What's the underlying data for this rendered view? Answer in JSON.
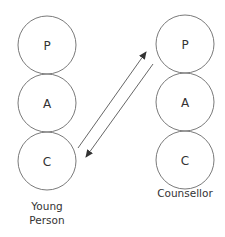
{
  "diagram": {
    "stroke_color": "#7a7a7a",
    "text_color": "#333333",
    "left": {
      "label_line1": "Young",
      "label_line2": "Person",
      "states": [
        "P",
        "A",
        "C"
      ]
    },
    "right": {
      "label": "Counsellor",
      "states": [
        "P",
        "A",
        "C"
      ]
    },
    "transactions": [
      {
        "from": "Young Person C",
        "to": "Counsellor P",
        "direction": "up"
      },
      {
        "from": "Counsellor P",
        "to": "Young Person C",
        "direction": "down"
      }
    ]
  }
}
